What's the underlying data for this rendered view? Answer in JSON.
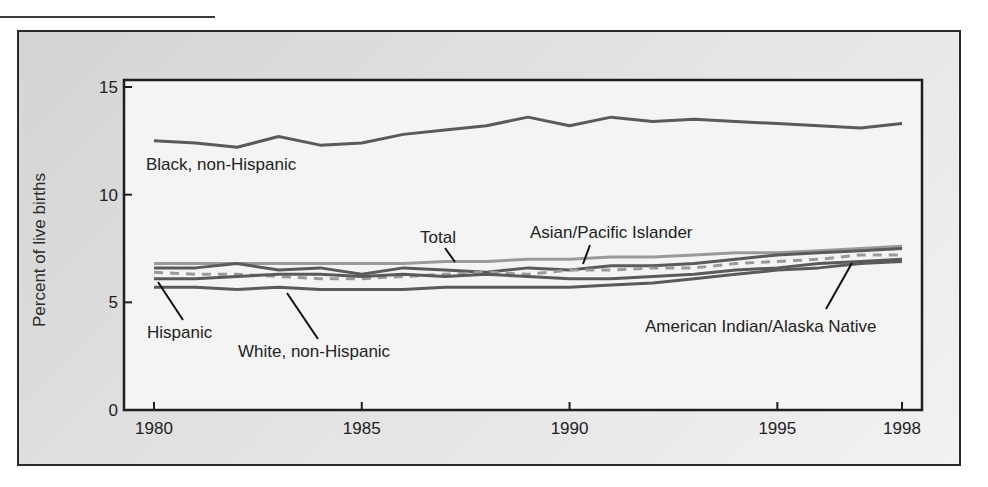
{
  "chart_data": {
    "type": "line",
    "title": "",
    "xlabel": "",
    "ylabel": "Percent of live births",
    "ylim": [
      0,
      15
    ],
    "yticks": [
      0,
      5,
      10,
      15
    ],
    "xticks": [
      1980,
      1985,
      1990,
      1995,
      1998
    ],
    "grid": false,
    "legend": "inline labels",
    "x": [
      1980,
      1981,
      1982,
      1983,
      1984,
      1985,
      1986,
      1987,
      1988,
      1989,
      1990,
      1991,
      1992,
      1993,
      1994,
      1995,
      1996,
      1997,
      1998
    ],
    "series": [
      {
        "name": "Black, non-Hispanic",
        "style": "solid",
        "color": "#5a5a5a",
        "values": [
          12.5,
          12.4,
          12.2,
          12.7,
          12.3,
          12.4,
          12.8,
          13.0,
          13.2,
          13.6,
          13.2,
          13.6,
          13.4,
          13.5,
          13.4,
          13.3,
          13.2,
          13.1,
          13.3
        ]
      },
      {
        "name": "Total",
        "style": "solid",
        "color": "#9a9a9a",
        "values": [
          6.8,
          6.8,
          6.8,
          6.8,
          6.8,
          6.8,
          6.8,
          6.9,
          6.9,
          7.0,
          7.0,
          7.1,
          7.1,
          7.2,
          7.3,
          7.3,
          7.4,
          7.5,
          7.6
        ]
      },
      {
        "name": "Asian/Pacific Islander",
        "style": "solid",
        "color": "#5a5a5a",
        "values": [
          6.6,
          6.6,
          6.8,
          6.5,
          6.6,
          6.3,
          6.6,
          6.5,
          6.4,
          6.6,
          6.5,
          6.7,
          6.7,
          6.8,
          7.0,
          7.2,
          7.3,
          7.4,
          7.5
        ]
      },
      {
        "name": "American Indian/Alaska Native",
        "style": "dashed",
        "color": "#9a9a9a",
        "values": [
          6.4,
          6.3,
          6.3,
          6.2,
          6.1,
          6.1,
          6.2,
          6.3,
          6.4,
          6.3,
          6.5,
          6.5,
          6.6,
          6.6,
          6.8,
          6.9,
          7.0,
          7.2,
          7.2
        ]
      },
      {
        "name": "Hispanic",
        "style": "solid",
        "color": "#5a5a5a",
        "values": [
          6.1,
          6.1,
          6.2,
          6.3,
          6.3,
          6.2,
          6.3,
          6.2,
          6.3,
          6.2,
          6.1,
          6.1,
          6.2,
          6.3,
          6.5,
          6.6,
          6.8,
          6.9,
          7.0
        ]
      },
      {
        "name": "White, non-Hispanic",
        "style": "solid",
        "color": "#5a5a5a",
        "values": [
          5.7,
          5.7,
          5.6,
          5.7,
          5.6,
          5.6,
          5.6,
          5.7,
          5.7,
          5.7,
          5.7,
          5.8,
          5.9,
          6.1,
          6.3,
          6.5,
          6.6,
          6.8,
          6.9
        ]
      }
    ],
    "labels": {
      "black": "Black, non-Hispanic",
      "total": "Total",
      "asian": "Asian/Pacific Islander",
      "hispanic": "Hispanic",
      "white": "White, non-Hispanic",
      "aian": "American Indian/Alaska Native"
    }
  }
}
